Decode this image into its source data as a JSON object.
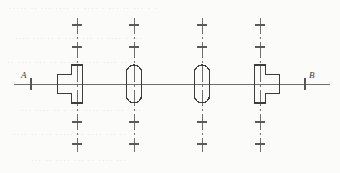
{
  "drawing": {
    "title": "Shaft assembly centerline schematic",
    "type": "engineering-line-drawing",
    "canvas": {
      "width": 340,
      "height": 173
    },
    "background_color": "#fbfbf9",
    "line_color": "#4a4a4a",
    "centerline_color": "#6b6b6b",
    "section_axis": {
      "name": "A-B",
      "left_label": "A",
      "right_label": "B",
      "y": 84,
      "x_start": 14,
      "x_end": 330,
      "left_tick_x": 31,
      "right_tick_x": 305
    },
    "vertical_centerlines": [
      {
        "x": 77,
        "y_top": 18,
        "y_bottom": 152,
        "ticks_y": [
          25,
          47,
          122,
          144
        ]
      },
      {
        "x": 134,
        "y_top": 18,
        "y_bottom": 152,
        "ticks_y": [
          25,
          47,
          122,
          144
        ]
      },
      {
        "x": 202,
        "y_top": 18,
        "y_bottom": 152,
        "ticks_y": [
          25,
          47,
          122,
          144
        ]
      },
      {
        "x": 260,
        "y_top": 18,
        "y_bottom": 152,
        "ticks_y": [
          25,
          47,
          122,
          144
        ]
      }
    ],
    "symbols": [
      {
        "id": "sym-1",
        "kind": "stepped-tee-left",
        "label": "stepped collar, flange toward left",
        "center_x": 77,
        "center_y": 84,
        "hub_width": 11,
        "hub_height": 38,
        "flange_width": 14,
        "flange_height": 19
      },
      {
        "id": "sym-2",
        "kind": "capsule",
        "label": "rounded-end journal",
        "center_x": 134,
        "center_y": 84,
        "width": 15,
        "height": 38
      },
      {
        "id": "sym-3",
        "kind": "capsule",
        "label": "rounded-end journal",
        "center_x": 202,
        "center_y": 84,
        "width": 15,
        "height": 38
      },
      {
        "id": "sym-4",
        "kind": "stepped-tee-right",
        "label": "stepped collar, flange toward right",
        "center_x": 260,
        "center_y": 84,
        "hub_width": 11,
        "hub_height": 38,
        "flange_width": 14,
        "flange_height": 19
      }
    ],
    "ghost_text": [
      {
        "text": "· · ··· ·· ··· · ···· ·· ···· ··· ·· ·····",
        "left": 8,
        "top": 4
      },
      {
        "text": "··· · ···· ·· ··· ···· · ·· ··· ····",
        "left": 14,
        "top": 34
      },
      {
        "text": "·· ···· ··· · ····· ·· ··· ···· ··",
        "left": 6,
        "top": 58
      },
      {
        "text": "···· ·· ··· ···· ··· · ·· ···· ···",
        "left": 20,
        "top": 106
      },
      {
        "text": "·· ··· ···· ·· ····· ··· ·· ····",
        "left": 12,
        "top": 130
      },
      {
        "text": "··· ···· ·· ··· ···· ·· ···",
        "left": 30,
        "top": 156
      }
    ]
  }
}
